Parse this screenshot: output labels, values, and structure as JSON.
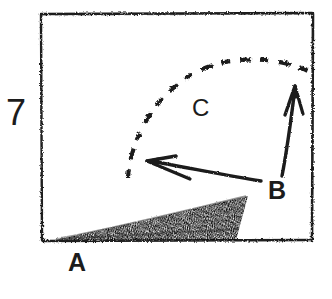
{
  "figure": {
    "number_label": "7",
    "background_color": "#ffffff",
    "ink_color": "#1c1c1c",
    "width": 332,
    "height": 299,
    "style": "hand-drawn charcoal sketch"
  },
  "frame": {
    "name": "sketched-rectangle-border",
    "left": 41,
    "top": 13,
    "right": 313,
    "bottom": 241
  },
  "labels": [
    {
      "id": "A",
      "text": "A",
      "x": 68,
      "y": 250,
      "describes": "textured wedge on ground"
    },
    {
      "id": "B",
      "text": "B",
      "x": 268,
      "y": 178,
      "describes": "vertical upward arrow"
    },
    {
      "id": "C",
      "text": "C",
      "x": 192,
      "y": 96,
      "describes": "dashed arc trajectory"
    }
  ],
  "shapes": {
    "wedge": {
      "name": "hatched-wedge",
      "label": "A",
      "fill": "charcoal-grain",
      "points": [
        [
          55,
          240
        ],
        [
          248,
          196
        ],
        [
          236,
          240
        ]
      ]
    },
    "arrow_left": {
      "name": "left-pointing-arrow",
      "from": [
        261,
        181
      ],
      "to": [
        147,
        161
      ],
      "head": "filled"
    },
    "arrow_up": {
      "name": "up-pointing-arrow",
      "label": "B",
      "from": [
        283,
        176
      ],
      "to": [
        295,
        86
      ],
      "head": "filled"
    },
    "arc_dashed": {
      "name": "dashed-arc",
      "label": "C",
      "start": [
        128,
        177
      ],
      "apex": [
        225,
        59
      ],
      "end": [
        308,
        72
      ],
      "stroke": "dashed"
    }
  }
}
